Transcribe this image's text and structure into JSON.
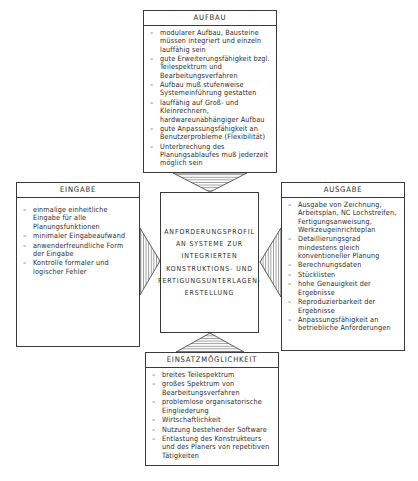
{
  "center": {
    "lines": [
      "ANFORDERUNGSPROFIL",
      "AN SYSTEME ZUR",
      "INTEGRIERTEN",
      "KONSTRUKTIONS- UND",
      "FERTIGUNGSUNTERLAGEN-",
      "ERSTELLUNG"
    ]
  },
  "boxes": {
    "aufbau": {
      "title": "AUFBAU",
      "items": [
        "modularer Aufbau, Bausteine müssen integriert und einzeln lauffähig sein",
        "gute Erweiterungsfähigkeit bzgl. Teilespektrum und Bearbeitungsverfahren",
        "Aufbau muß stufenweise Systemeinführung gestatten",
        "lauffähig auf Groß- und Kleinrechnern, hardwareunabhängiger Aufbau",
        "gute Anpassungsfähigkeit an Benutzerprobleme (Flexibilität)",
        "Unterbrechung des Planungsablaufes muß jederzeit möglich sein"
      ]
    },
    "eingabe": {
      "title": "EINGABE",
      "items": [
        "einmalige einheitliche Eingabe für alle Planungsfunktionen",
        "minimaler Eingabeaufwand",
        "anwenderfreundliche Form der Eingabe",
        "Kontrolle formaler und logischer Fehler"
      ]
    },
    "ausgabe": {
      "title": "AUSGABE",
      "items": [
        "Ausgabe von Zeichnung, Arbeitsplan, NC Lochstreifen, Fertigungsanweisung, Werkzeugeinrichteplan",
        "Detaillierungsgrad mindestens gleich konventioneller Planung",
        "Berechnungsdaten",
        "Stücklisten",
        "hohe Genauigkeit der Ergebnisse",
        "Reproduzierbarkeit der Ergebnisse",
        "Anpassungsfähigkeit an betriebliche Anforderungen"
      ]
    },
    "einsatz": {
      "title": "EINSATZMÖGLICHKEIT",
      "items": [
        "breites Teilespektrum",
        "großes Spektrum von Bearbeitungsverfahren",
        "problemlose organisatorische Eingliederung",
        "Wirtschaftlichkeit",
        "Nutzung bestehender Software",
        "Entlastung des Konstrukteurs und des Planers von repetitiven Tätigkeiten"
      ]
    }
  }
}
